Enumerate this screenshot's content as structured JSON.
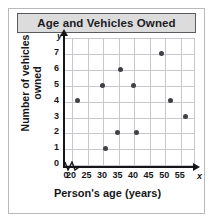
{
  "chart_data": {
    "type": "scatter",
    "title": "Age and Vehicles Owned",
    "xlabel": "Person's age (years)",
    "ylabel_line1": "Number of vehicles",
    "ylabel_line2": "owned",
    "x_axis_letter": "x",
    "y_axis_letter": "y",
    "xlim": [
      18,
      59
    ],
    "ylim": [
      0,
      7.6
    ],
    "x_ticks": [
      0,
      20,
      25,
      30,
      35,
      40,
      45,
      50,
      55
    ],
    "y_ticks": [
      0,
      1,
      2,
      3,
      4,
      5,
      6,
      7
    ],
    "x_tick_labels": [
      "0",
      "20",
      "25",
      "30",
      "35",
      "40",
      "45",
      "50",
      "55"
    ],
    "y_tick_labels": [
      "0",
      "1",
      "2",
      "3",
      "4",
      "5",
      "6",
      "7"
    ],
    "grid": true,
    "legend": "none",
    "axis_break_x": true,
    "point_color": "#404045",
    "grid_color": "#c8c8cc",
    "axis_color": "#16161a",
    "title_bar_color": "#dcdcdc",
    "points": [
      {
        "x": 22,
        "y": 4
      },
      {
        "x": 30,
        "y": 5
      },
      {
        "x": 31,
        "y": 1
      },
      {
        "x": 35,
        "y": 2
      },
      {
        "x": 36,
        "y": 6
      },
      {
        "x": 40,
        "y": 5
      },
      {
        "x": 41,
        "y": 2
      },
      {
        "x": 49,
        "y": 7
      },
      {
        "x": 52,
        "y": 4
      },
      {
        "x": 57,
        "y": 3
      }
    ]
  }
}
